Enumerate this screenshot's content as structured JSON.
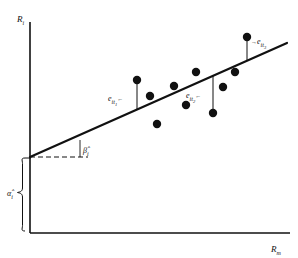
{
  "figure": {
    "axes": {
      "y_label_base": "R",
      "y_label_sub": "i",
      "x_label_base": "R",
      "x_label_sub": "m",
      "axis_color": "#111111"
    },
    "parameters": {
      "intercept_label_base": "α̂",
      "intercept_label_sub": "i",
      "slope_label_base": "β̂",
      "slope_label_sub": "i"
    },
    "residuals": [
      {
        "label_base": "e",
        "label_sub": "it",
        "label_subsub": "1",
        "arrow": "←"
      },
      {
        "label_base": "e",
        "label_sub": "it",
        "label_subsub": "2",
        "arrow": "←"
      },
      {
        "label_base": "e",
        "label_sub": "it",
        "label_subsub": "3",
        "arrow": "→"
      }
    ]
  },
  "chart_data": {
    "type": "scatter",
    "title": "",
    "xlabel": "R_m",
    "ylabel": "R_i",
    "grid": false,
    "legend": null,
    "xlim": [
      0,
      298
    ],
    "ylim": [
      0,
      258
    ],
    "note": "Values given in pixel coordinates of the original figure; axis has no numeric tick labels.",
    "points": [
      {
        "x": 137,
        "y": 80
      },
      {
        "x": 150,
        "y": 96
      },
      {
        "x": 157,
        "y": 124
      },
      {
        "x": 174,
        "y": 86
      },
      {
        "x": 186,
        "y": 105
      },
      {
        "x": 196,
        "y": 72
      },
      {
        "x": 213,
        "y": 113
      },
      {
        "x": 223,
        "y": 87
      },
      {
        "x": 235,
        "y": 72
      },
      {
        "x": 247,
        "y": 37
      }
    ],
    "regression_line": {
      "x0": 30,
      "y0": 157,
      "x1": 287,
      "y1": 43,
      "color": "#111111",
      "width": 2.2
    },
    "residual_segments": [
      {
        "x": 137,
        "y_point": 80,
        "y_line": 109
      },
      {
        "x": 213,
        "y_point": 113,
        "y_line": 75
      },
      {
        "x": 247,
        "y_point": 37,
        "y_line": 61
      }
    ],
    "dashed_guide": {
      "x0": 30,
      "x1": 88,
      "y": 157
    },
    "slope_tick": {
      "x": 80,
      "y0": 140,
      "y1": 157
    }
  }
}
